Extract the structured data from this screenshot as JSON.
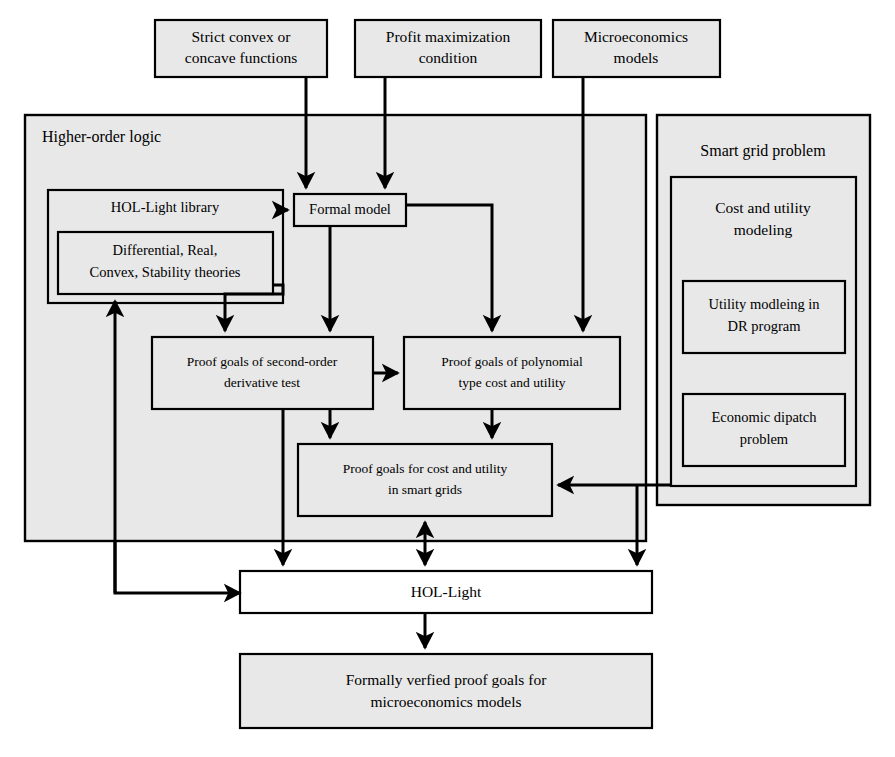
{
  "diagram": {
    "colors": {
      "box_fill": "#e8e8e8",
      "white_fill": "#ffffff",
      "stroke": "#000000",
      "background": "#ffffff"
    },
    "top_inputs": [
      {
        "id": "strict-convex",
        "line1": "Strict convex or",
        "line2": "concave functions"
      },
      {
        "id": "profit-max",
        "line1": "Profit maximization",
        "line2": "condition"
      },
      {
        "id": "microeconomics",
        "line1": "Microeconomics",
        "line2": "models"
      }
    ],
    "higher_order_logic": {
      "title": "Higher-order logic",
      "hol_light_library": {
        "label": "HOL-Light library"
      },
      "theories": {
        "line1": "Differential, Real,",
        "line2": "Convex, Stability theories"
      },
      "formal_model": {
        "label": "Formal model"
      },
      "proof_goals_second_order": {
        "line1": "Proof goals of second-order",
        "line2": "derivative test"
      },
      "proof_goals_polynomial": {
        "line1": "Proof goals of polynomial",
        "line2": "type cost and utility"
      },
      "proof_goals_smart_grids": {
        "line1": "Proof goals for cost and utility",
        "line2": "in smart grids"
      }
    },
    "smart_grid_problem": {
      "title": "Smart grid problem",
      "cost_and_utility_modeling": {
        "line1": "Cost and utility",
        "line2": "modeling"
      },
      "utility_modeling_dr": {
        "line1": "Utility modleing in",
        "line2": "DR program"
      },
      "economic_dispatch": {
        "line1": "Economic dipatch",
        "line2": "problem"
      }
    },
    "hol_light": {
      "label": "HOL-Light"
    },
    "output": {
      "line1": "Formally verfied proof goals for",
      "line2": "microeconomics models"
    },
    "edges": [
      {
        "from": "strict-convex",
        "to": "formal-model",
        "kind": "arrow"
      },
      {
        "from": "profit-max",
        "to": "formal-model",
        "kind": "arrow"
      },
      {
        "from": "microeconomics",
        "to": "proof-goals-polynomial",
        "kind": "arrow"
      },
      {
        "from": "hol-light-library",
        "to": "formal-model",
        "kind": "arrow"
      },
      {
        "from": "theories",
        "to": "proof-goals-second-order",
        "kind": "arrow"
      },
      {
        "from": "formal-model",
        "to": "proof-goals-second-order",
        "kind": "arrow"
      },
      {
        "from": "formal-model",
        "to": "proof-goals-polynomial",
        "kind": "arrow"
      },
      {
        "from": "proof-goals-second-order",
        "to": "proof-goals-polynomial",
        "kind": "arrow"
      },
      {
        "from": "proof-goals-second-order",
        "to": "proof-goals-smart-grids",
        "kind": "arrow"
      },
      {
        "from": "proof-goals-polynomial",
        "to": "proof-goals-smart-grids",
        "kind": "arrow"
      },
      {
        "from": "smart-grid-problem",
        "to": "proof-goals-smart-grids",
        "kind": "arrow"
      },
      {
        "from": "proof-goals-second-order",
        "to": "hol-light",
        "kind": "arrow"
      },
      {
        "from": "proof-goals-smart-grids",
        "to": "hol-light",
        "kind": "double-arrow"
      },
      {
        "from": "smart-grid-problem",
        "to": "hol-light",
        "kind": "arrow"
      },
      {
        "from": "hol-light",
        "to": "theories",
        "kind": "feedback-arrow"
      },
      {
        "from": "hol-light",
        "to": "output",
        "kind": "arrow"
      }
    ]
  }
}
